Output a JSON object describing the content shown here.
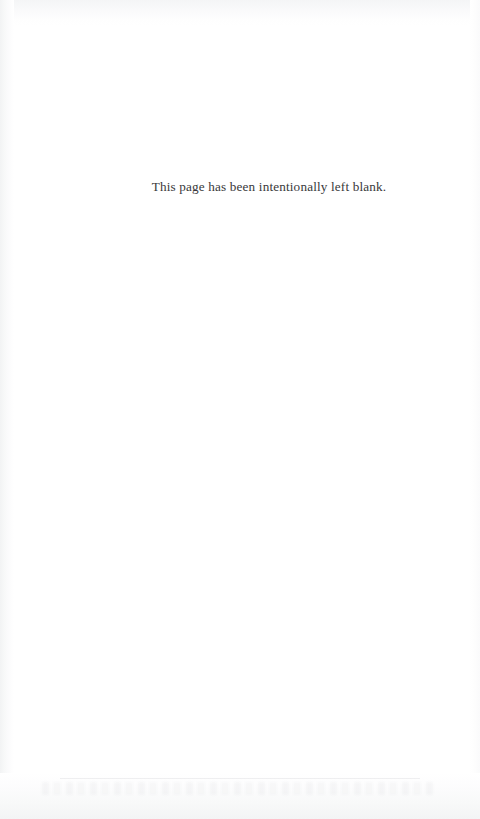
{
  "page": {
    "kind": "scanned-book-page",
    "width": 480,
    "height": 819,
    "background_color": "#ffffff",
    "notice_text": "This page has been intentionally left blank.",
    "notice_color": "#38383a",
    "artifacts": {
      "left_edge_tone": "#f2f3f4",
      "right_edge_tone": "#fafafb",
      "top_edge_tone": "#f4f5f6",
      "bottom_edge_tone": "#f3f4f5",
      "bleed_through_legible": false
    }
  }
}
